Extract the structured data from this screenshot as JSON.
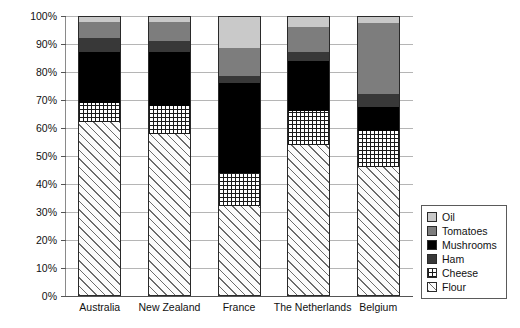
{
  "chart_data": {
    "type": "bar",
    "stacked": true,
    "normalized": true,
    "title": "",
    "subtitle": "",
    "xlabel": "",
    "ylabel": "",
    "ylim": [
      0,
      100
    ],
    "grid": true,
    "legend_position": "bottom-right",
    "categories": [
      "Australia",
      "New Zealand",
      "France",
      "The Netherlands",
      "Belgium"
    ],
    "ticks": [
      "0%",
      "10%",
      "20%",
      "30%",
      "40%",
      "50%",
      "60%",
      "70%",
      "80%",
      "90%",
      "100%"
    ],
    "tick_values": [
      0,
      10,
      20,
      30,
      40,
      50,
      60,
      70,
      80,
      90,
      100
    ],
    "stack_order_bottom_to_top": [
      "Flour",
      "Cheese",
      "Mushrooms",
      "Ham",
      "Tomatoes",
      "Oil"
    ],
    "series": [
      {
        "name": "Flour",
        "color": "#fbfbfb",
        "pattern": "diagonal-hatch",
        "values": [
          62,
          58,
          32,
          54,
          46
        ]
      },
      {
        "name": "Cheese",
        "color": "#ffffff",
        "pattern": "grid-dots",
        "values": [
          7,
          10,
          12,
          12,
          13
        ]
      },
      {
        "name": "Mushrooms",
        "color": "#000000",
        "pattern": "solid",
        "values": [
          18,
          19,
          32,
          18,
          8.5
        ]
      },
      {
        "name": "Ham",
        "color": "#383838",
        "pattern": "solid",
        "values": [
          5,
          4,
          2.5,
          3,
          4.5
        ]
      },
      {
        "name": "Tomatoes",
        "color": "#7d7d7d",
        "pattern": "solid",
        "values": [
          6,
          7,
          10,
          9,
          25.5
        ]
      },
      {
        "name": "Oil",
        "color": "#c9c9c9",
        "pattern": "solid",
        "values": [
          2,
          2,
          11.5,
          4,
          2.5
        ]
      }
    ],
    "cumulative_tops": {
      "Australia": {
        "Flour": 62,
        "Cheese": 69,
        "Mushrooms": 87,
        "Ham": 92,
        "Tomatoes": 98,
        "Oil": 100
      },
      "New Zealand": {
        "Flour": 58,
        "Cheese": 68,
        "Mushrooms": 87,
        "Ham": 91,
        "Tomatoes": 98,
        "Oil": 100
      },
      "France": {
        "Flour": 32,
        "Cheese": 44,
        "Mushrooms": 76,
        "Ham": 78.5,
        "Tomatoes": 88.5,
        "Oil": 100
      },
      "The Netherlands": {
        "Flour": 54,
        "Cheese": 66,
        "Mushrooms": 84,
        "Ham": 87,
        "Tomatoes": 96,
        "Oil": 100
      },
      "Belgium": {
        "Flour": 46,
        "Cheese": 59,
        "Mushrooms": 67.5,
        "Ham": 72,
        "Tomatoes": 97.5,
        "Oil": 100
      }
    }
  },
  "legend": {
    "items": [
      {
        "label": "Oil"
      },
      {
        "label": "Tomatoes"
      },
      {
        "label": "Mushrooms"
      },
      {
        "label": "Ham"
      },
      {
        "label": "Cheese"
      },
      {
        "label": "Flour"
      }
    ]
  }
}
